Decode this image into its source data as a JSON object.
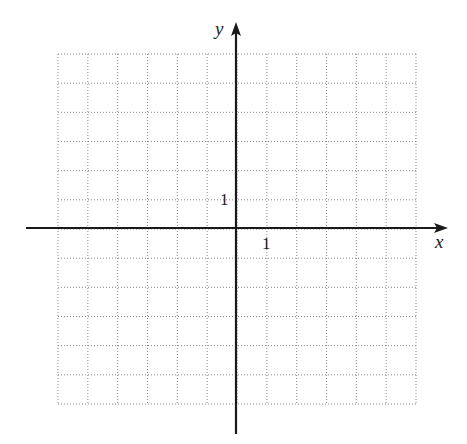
{
  "chart_data": {
    "type": "scatter",
    "title": "",
    "xlabel": "x",
    "ylabel": "y",
    "xlim": [
      -6,
      6
    ],
    "ylim": [
      -6,
      6
    ],
    "grid": true,
    "grid_style": "dotted",
    "tick_labels": {
      "x": [
        "1"
      ],
      "y": [
        "1"
      ]
    },
    "series": []
  },
  "axes": {
    "x_label": "x",
    "y_label": "y",
    "x_tick_label": "1",
    "y_tick_label": "1",
    "axis_color": "#1a1a1a",
    "grid_color": "#888888"
  }
}
